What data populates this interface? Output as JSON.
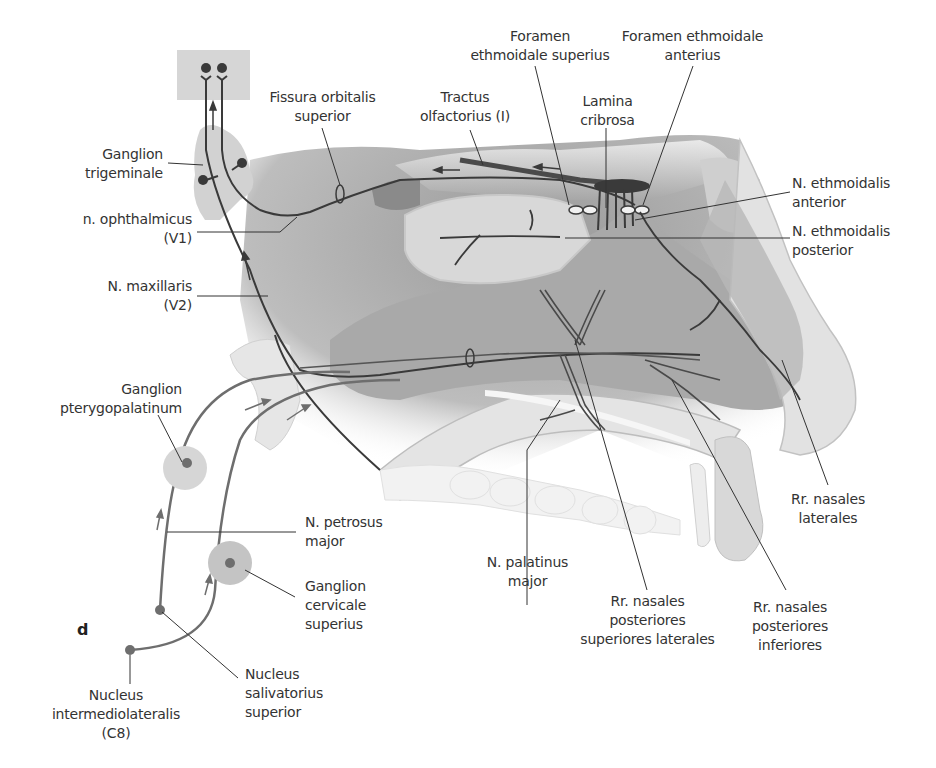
{
  "figure": {
    "panel_letter": "d",
    "colors": {
      "nerve": "#3a3a3a",
      "autonomic_fiber": "#6e6e6e",
      "tissue_dark": "#8c8c8c",
      "tissue_mid": "#b5b5b5",
      "tissue_light": "#dcdcdc",
      "ganglion_fill": "#d2d2d2",
      "label_text": "#333333"
    },
    "labels": {
      "ganglion_trigeminale": "Ganglion\ntrigeminale",
      "fissura_orbitalis_superior": "Fissura orbitalis\nsuperior",
      "tractus_olfactorius": "Tractus\nolfactorius (I)",
      "foramen_ethmoidale_superius": "Foramen\nethmoidale superius",
      "lamina_cribrosa": "Lamina\ncribrosa",
      "foramen_ethmoidale_anterius": "Foramen ethmoidale\nanterius",
      "n_ophthalmicus": "n. ophthalmicus\n(V1)",
      "n_maxillaris": "N. maxillaris\n(V2)",
      "n_ethmoidalis_anterior": "N. ethmoidalis\nanterior",
      "n_ethmoidalis_posterior": "N. ethmoidalis\nposterior",
      "ganglion_pterygopalatinum": "Ganglion\npterygopalatinum",
      "n_petrosus_major": "N. petrosus\nmajor",
      "ganglion_cervicale_superius": "Ganglion\ncervicale\nsuperius",
      "nucleus_salivatorius_superior": "Nucleus\nsalivatorius\nsuperior",
      "nucleus_intermediolateralis": "Nucleus\nintermediolateralis\n(C8)",
      "n_palatinus_major": "N. palatinus\nmajor",
      "rr_nasales_post_sup_lat": "Rr. nasales\nposteriores\nsuperiores laterales",
      "rr_nasales_post_inf": "Rr. nasales\nposteriores\ninferiores",
      "rr_nasales_laterales": "Rr. nasales\nlaterales"
    }
  }
}
